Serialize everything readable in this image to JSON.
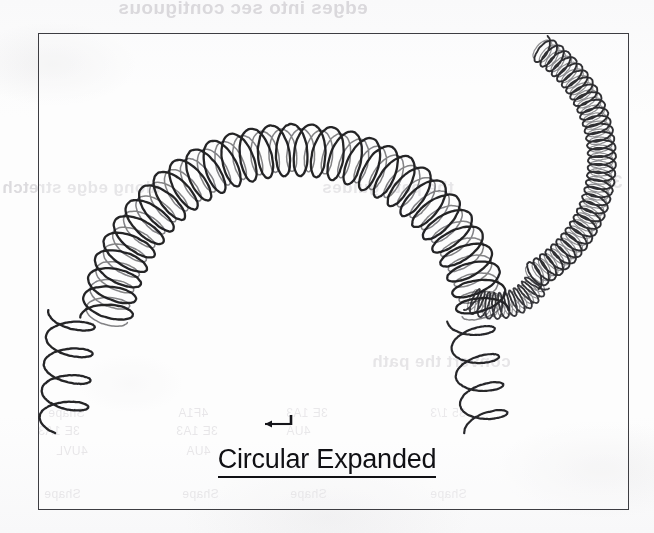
{
  "page": {
    "width": 654,
    "height": 533,
    "background_color": "#fdfdfd",
    "ink_color": "#1b1b20",
    "border_color": "#3d3d42",
    "bleed_text_color": "#d2d0d4"
  },
  "figure": {
    "frame": {
      "x": 38,
      "y": 33,
      "width": 591,
      "height": 477,
      "border_width": 1.6
    },
    "caption": "Circular Expanded",
    "caption_underlined": true,
    "enter_arrow_icon": "left-arrow-with-stem-icon"
  },
  "drawing": {
    "description": "Two hand-drawn helical coil springs bent along circular paths",
    "shapes": [
      {
        "name": "large-expanded-coil",
        "label": "Circular Expanded coil",
        "path_type": "circular-arc",
        "turns": 30,
        "coil_radius": 26,
        "pitch": "expanded",
        "arc": {
          "center_x": 295,
          "center_y": 340,
          "radius": 190,
          "start_deg": 186,
          "end_deg": 352
        },
        "tail_start": {
          "x": 66,
          "y": 330,
          "length": 96
        },
        "tail_end": {
          "x": 465,
          "y": 340,
          "length": 96
        }
      },
      {
        "name": "small-compressed-coil",
        "label": "tightly wound coil",
        "path_type": "circular-arc",
        "turns": 34,
        "coil_radius": 14,
        "pitch": "compressed",
        "arc": {
          "center_x": 470,
          "center_y": 160,
          "radius": 132,
          "start_deg": -58,
          "end_deg": 62
        }
      }
    ]
  },
  "bleed_through": {
    "note": "faint mirrored text bleeding through from the reverse side of the scanned page",
    "top_line": "edges into sec contiguous",
    "mid_left": "along edge stretch",
    "mid_right": "the path guides",
    "path_line": "convert the path",
    "number_right": "3",
    "table_fragments": {
      "col_a": [
        "Shape",
        "3E 1A3",
        "4UVL",
        "Shape"
      ],
      "col_b": [
        "4F1A",
        "3E 1A3",
        "4UA",
        "Shape"
      ],
      "col_c": [
        "3E 1A3",
        "4UA",
        "Shape"
      ],
      "col_d": [
        "35 1/3",
        "Shape"
      ]
    }
  }
}
